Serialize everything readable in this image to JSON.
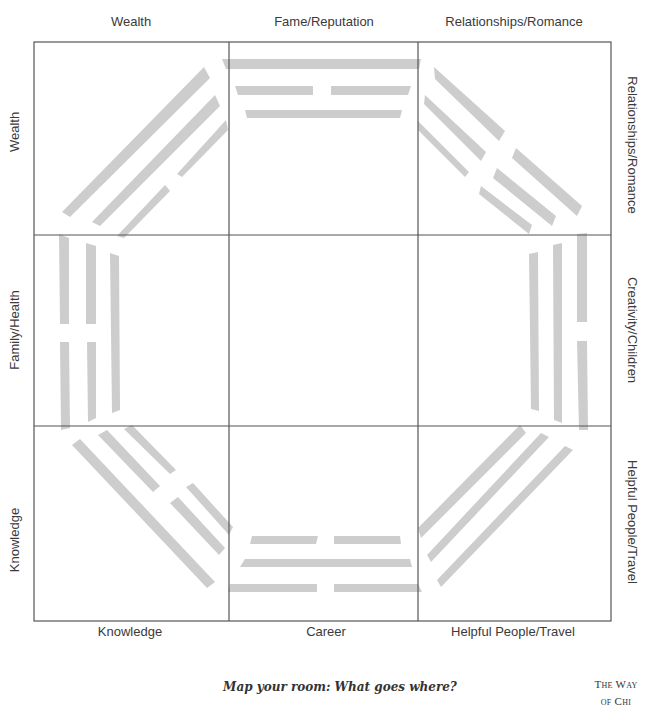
{
  "diagram": {
    "type": "bagua-grid",
    "grid": {
      "rows": 3,
      "cols": 3,
      "line_color": "#555555",
      "bar_color": "#cccccc"
    },
    "top_labels": [
      "Wealth",
      "Fame/Reputation",
      "Relationships/Romance"
    ],
    "bottom_labels": [
      "Knowledge",
      "Career",
      "Helpful People/Travel"
    ],
    "left_labels": [
      "Wealth",
      "Family/Health",
      "Knowledge"
    ],
    "right_labels": [
      "Relationships/Romance",
      "Creativity/Children",
      "Helpful People/Travel"
    ],
    "trigrams": [
      {
        "position": "top",
        "lines_outer_to_inner": [
          "solid",
          "broken",
          "solid"
        ]
      },
      {
        "position": "top-right",
        "lines_outer_to_inner": [
          "broken",
          "broken",
          "broken"
        ]
      },
      {
        "position": "right",
        "lines_outer_to_inner": [
          "broken",
          "solid",
          "solid"
        ]
      },
      {
        "position": "bottom-right",
        "lines_outer_to_inner": [
          "solid",
          "solid",
          "solid"
        ]
      },
      {
        "position": "bottom",
        "lines_outer_to_inner": [
          "broken",
          "solid",
          "broken"
        ]
      },
      {
        "position": "bottom-left",
        "lines_outer_to_inner": [
          "solid",
          "broken",
          "broken"
        ]
      },
      {
        "position": "left",
        "lines_outer_to_inner": [
          "broken",
          "broken",
          "solid"
        ]
      },
      {
        "position": "top-left",
        "lines_outer_to_inner": [
          "solid",
          "solid",
          "broken"
        ]
      }
    ]
  },
  "caption": "Map your room: What goes where?",
  "brand": {
    "line1": "The Way",
    "line2": "of Chi"
  }
}
